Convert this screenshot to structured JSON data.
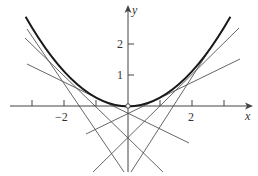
{
  "diagram": {
    "type": "function-with-tangent-lines",
    "curve": {
      "equation": "y = x^2/4",
      "x_range": [
        -3.2,
        3.2
      ]
    },
    "tangent_points_a": [
      -3,
      -2,
      -1,
      1,
      2,
      3
    ],
    "axes": {
      "x_label": "x",
      "y_label": "y",
      "x_ticks": [
        -3,
        -2,
        -1,
        1,
        2,
        3
      ],
      "x_tick_labels": [
        {
          "value": -2,
          "text": "−2"
        },
        {
          "value": 2,
          "text": "2"
        }
      ],
      "y_ticks": [
        1,
        2
      ],
      "y_tick_labels": [
        {
          "value": 1,
          "text": "1"
        },
        {
          "value": 2,
          "text": "2"
        }
      ]
    },
    "origin_marker": "open-circle",
    "colors": {
      "curve": "#1a1a1a",
      "lines": "#555555",
      "axes": "#444444"
    }
  },
  "labels": {
    "x_axis": "x",
    "y_axis": "y",
    "tick_x_neg2": "−2",
    "tick_x_2": "2",
    "tick_y_1": "1",
    "tick_y_2": "2"
  }
}
